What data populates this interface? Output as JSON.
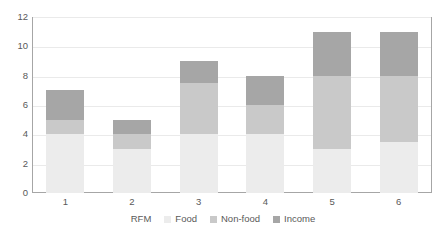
{
  "chart_data": {
    "type": "bar",
    "stacked": true,
    "title": "",
    "xlabel": "RFM",
    "ylabel": "",
    "categories": [
      "1",
      "2",
      "3",
      "4",
      "5",
      "6"
    ],
    "ylim": [
      0,
      12
    ],
    "yticks": [
      0,
      2,
      4,
      6,
      8,
      10,
      12
    ],
    "ytick_labels": [
      "0",
      "2",
      "4",
      "6",
      "8",
      "10",
      "12"
    ],
    "grid": true,
    "grid_axis": "y",
    "legend_position": "bottom",
    "series": [
      {
        "name": "Food",
        "color": "#ececec",
        "values": [
          4,
          3,
          4,
          4,
          3,
          3.5
        ]
      },
      {
        "name": "Non-food",
        "color": "#c9c9c9",
        "values": [
          1,
          1,
          3.5,
          2,
          5,
          4.5
        ]
      },
      {
        "name": "Income",
        "color": "#a6a6a6",
        "values": [
          2,
          1,
          1.5,
          2,
          3,
          3
        ]
      }
    ],
    "totals": [
      7,
      5,
      9,
      8,
      11,
      11
    ],
    "colors": {
      "food": "#ececec",
      "nonfood": "#c9c9c9",
      "income": "#a6a6a6",
      "gridline": "#eaeaea",
      "axis": "#a6a6a6",
      "text": "#595959",
      "background": "#ffffff"
    }
  }
}
